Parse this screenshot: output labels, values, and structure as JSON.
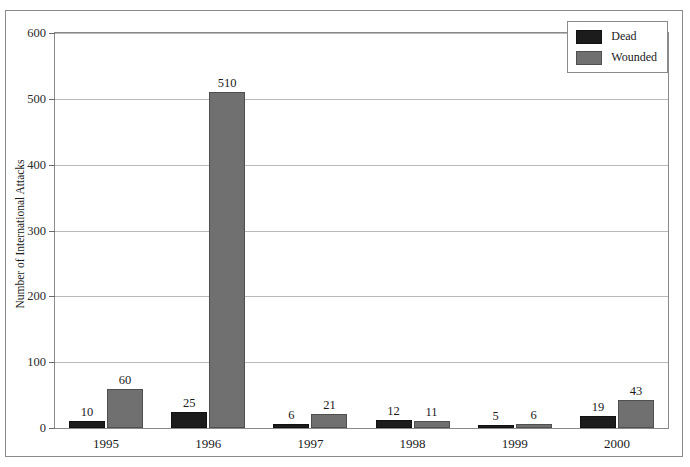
{
  "chart_data": {
    "type": "bar",
    "title": "",
    "xlabel": "",
    "ylabel": "Number of International Attacks",
    "categories": [
      "1995",
      "1996",
      "1997",
      "1998",
      "1999",
      "2000"
    ],
    "series": [
      {
        "name": "Dead",
        "color": "#1c1c1c",
        "values": [
          10,
          25,
          6,
          12,
          5,
          19
        ]
      },
      {
        "name": "Wounded",
        "color": "#707070",
        "values": [
          60,
          510,
          21,
          11,
          6,
          43
        ]
      }
    ],
    "ylim": [
      0,
      600
    ],
    "yticks": [
      0,
      100,
      200,
      300,
      400,
      500,
      600
    ],
    "ytick_labels": [
      "0",
      "100",
      "200",
      "300",
      "400",
      "500",
      "600"
    ],
    "grid": true,
    "grid_axis": "y",
    "legend_position": "top-right",
    "data_labels": true
  },
  "legend": {
    "entries": [
      {
        "label": "Dead"
      },
      {
        "label": "Wounded"
      }
    ]
  },
  "axes": {
    "y_title": "Number of International Attacks"
  }
}
